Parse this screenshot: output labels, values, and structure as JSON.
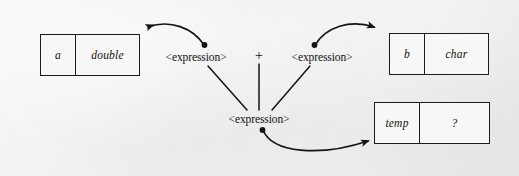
{
  "figure": {
    "background_color": "#f1f1f0",
    "ink_color": "#141414"
  },
  "boxes": [
    {
      "id": "box-a",
      "name": "a",
      "type": "double",
      "x": 40,
      "y": 34,
      "width": 100,
      "height": 42,
      "split": 34
    },
    {
      "id": "box-b",
      "name": "b",
      "type": "char",
      "x": 389,
      "y": 33,
      "width": 100,
      "height": 42,
      "split": 34
    },
    {
      "id": "box-temp",
      "name": "temp",
      "type": "?",
      "x": 374,
      "y": 102,
      "width": 116,
      "height": 42,
      "split": 44
    }
  ],
  "labels": {
    "expression_left": "<expression>",
    "expression_right": "<expression>",
    "expression_bottom": "<expression>",
    "operator": "+"
  },
  "nodes": [
    {
      "id": "expr-left",
      "text": "<expression>",
      "x": 196,
      "y": 57
    },
    {
      "id": "operator",
      "text": "+",
      "x": 259,
      "y": 56
    },
    {
      "id": "expr-right",
      "text": "<expression>",
      "x": 322,
      "y": 57
    },
    {
      "id": "expr-bottom",
      "text": "<expression>",
      "x": 259,
      "y": 119
    }
  ],
  "connectors": {
    "straight": [
      {
        "id": "line-left-to-bottom",
        "from": "expr-left",
        "to": "expr-bottom"
      },
      {
        "id": "line-op-to-bottom",
        "from": "operator",
        "to": "expr-bottom"
      },
      {
        "id": "line-right-to-bottom",
        "from": "expr-right",
        "to": "expr-bottom"
      }
    ],
    "arrows": [
      {
        "id": "arrow-expr-left-to-box-a",
        "from": "expr-left",
        "to": "box-a",
        "style": "curved",
        "has_origin_dot": true
      },
      {
        "id": "arrow-expr-right-to-box-b",
        "from": "expr-right",
        "to": "box-b",
        "style": "curved",
        "has_origin_dot": true
      },
      {
        "id": "arrow-expr-bottom-to-temp",
        "from": "expr-bottom",
        "to": "box-temp",
        "style": "curved",
        "has_origin_dot": true
      }
    ]
  }
}
